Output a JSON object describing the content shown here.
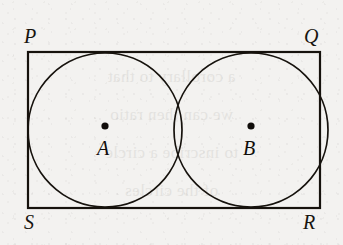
{
  "figure": {
    "type": "geometry-diagram",
    "background_color": "#f3f2f0",
    "ink_color": "#16120d",
    "rectangle": {
      "name": "PQRS",
      "x": 28,
      "y": 52,
      "width": 292,
      "height": 156,
      "stroke_width": 2.2,
      "vertices": [
        {
          "id": "P",
          "label": "P",
          "position": "top-left"
        },
        {
          "id": "Q",
          "label": "Q",
          "position": "top-right"
        },
        {
          "id": "R",
          "label": "R",
          "position": "bottom-right"
        },
        {
          "id": "S",
          "label": "S",
          "position": "bottom-left"
        }
      ]
    },
    "circles": [
      {
        "id": "A",
        "center_label": "A",
        "cx": 105,
        "cy": 130,
        "r": 77,
        "stroke_width": 1.7
      },
      {
        "id": "B",
        "center_label": "B",
        "cx": 251,
        "cy": 130,
        "r": 77,
        "stroke_width": 1.7
      }
    ],
    "center_dots": [
      {
        "id": "dot-A",
        "cx": 105,
        "cy": 126,
        "r": 3.6
      },
      {
        "id": "dot-B",
        "cx": 251,
        "cy": 126,
        "r": 3.6
      }
    ],
    "bleed_through_lines": [
      "a corollary to that",
      "we can then ratio",
      "to inscribe a circle",
      "of the circles"
    ]
  }
}
